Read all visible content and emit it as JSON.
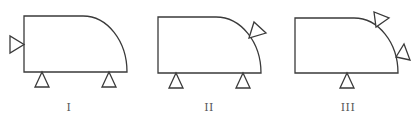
{
  "figures": [
    {
      "id": "fig-1",
      "label": "I",
      "label_x": 69,
      "body": {
        "left": 24,
        "top": 16,
        "arc_start_x": 83,
        "right": 127,
        "bottom": 72
      },
      "supports": [
        {
          "type": "side-left",
          "points": "10,36 10,53 24,44.5"
        },
        {
          "type": "bottom",
          "points": "42,72 35,87 49,87"
        },
        {
          "type": "bottom",
          "points": "109,72 102,87 116,87"
        }
      ]
    },
    {
      "id": "fig-2",
      "label": "II",
      "label_x": 209,
      "body": {
        "left": 158,
        "top": 17,
        "arc_start_x": 216,
        "right": 261,
        "bottom": 73
      },
      "supports": [
        {
          "type": "bottom",
          "points": "176,73 169,88 183,88"
        },
        {
          "type": "bottom",
          "points": "243,73 236,88 250,88"
        },
        {
          "type": "arc-tilted",
          "points": "249,38 254,22 266,33"
        }
      ]
    },
    {
      "id": "fig-3",
      "label": "III",
      "label_x": 348,
      "body": {
        "left": 295,
        "top": 18,
        "arc_start_x": 354,
        "right": 398,
        "bottom": 73
      },
      "supports": [
        {
          "type": "bottom",
          "points": "347,73 340,88 354,88"
        },
        {
          "type": "arc-tilted",
          "points": "376,27 374,12 389,18"
        },
        {
          "type": "arc-tilted",
          "points": "396,57 404,44 410,60"
        }
      ]
    }
  ],
  "colors": {
    "stroke": "#3a3a3a",
    "label": "#555555",
    "background": "#ffffff"
  }
}
